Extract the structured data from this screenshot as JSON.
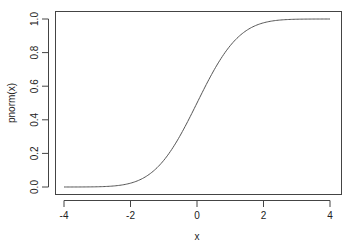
{
  "chart_data": {
    "type": "line",
    "title": "",
    "xlabel": "x",
    "ylabel": "pnorm(x)",
    "xlim": [
      -4,
      4
    ],
    "ylim": [
      0,
      1
    ],
    "grid": false,
    "legend": null,
    "x_ticks": [
      "-4",
      "-2",
      "0",
      "2",
      "4"
    ],
    "y_ticks": [
      "0.0",
      "0.2",
      "0.4",
      "0.6",
      "0.8",
      "1.0"
    ],
    "series": [
      {
        "name": "pnorm(x)",
        "color": "#555555",
        "x": [
          -4,
          -3.5,
          -3,
          -2.5,
          -2,
          -1.75,
          -1.5,
          -1.25,
          -1,
          -0.75,
          -0.5,
          -0.25,
          0,
          0.25,
          0.5,
          0.75,
          1,
          1.25,
          1.5,
          1.75,
          2,
          2.5,
          3,
          3.5,
          4
        ],
        "y": [
          3e-05,
          0.0002,
          0.0013,
          0.0062,
          0.0228,
          0.0401,
          0.0668,
          0.1056,
          0.1587,
          0.2266,
          0.3085,
          0.4013,
          0.5,
          0.5987,
          0.6915,
          0.7734,
          0.8413,
          0.8944,
          0.9332,
          0.9599,
          0.9772,
          0.9938,
          0.9987,
          0.9998,
          0.99997
        ]
      }
    ]
  },
  "colors": {
    "axis": "#444444",
    "line": "#555555",
    "text": "#222222"
  }
}
